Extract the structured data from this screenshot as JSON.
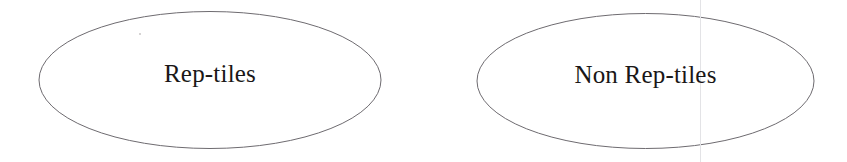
{
  "page": {
    "background_color": "#ffffff",
    "width": 847,
    "height": 162
  },
  "diagram": {
    "type": "two-set-grouping",
    "stroke_color": "#6e6b70",
    "stroke_width": 1,
    "fill_color": "#ffffff",
    "text_color": "#1a1717",
    "groups": [
      {
        "id": "rep-tiles",
        "label": "Rep-tiles",
        "shape": "ellipse",
        "cx": 210,
        "cy": 80,
        "rx": 171,
        "ry": 68.5
      },
      {
        "id": "non-rep-tiles",
        "label": "Non Rep-tiles",
        "shape": "ellipse",
        "cx": 645.5,
        "cy": 81,
        "rx": 168.5,
        "ry": 67.5
      }
    ]
  },
  "artifacts": {
    "scan_line": {
      "name": "vertical-scan-line",
      "x": 700,
      "color": "#e3e3e6"
    },
    "speck": {
      "name": "dust-speck",
      "x": 139,
      "y": 33,
      "color": "#c9c6c6"
    }
  }
}
